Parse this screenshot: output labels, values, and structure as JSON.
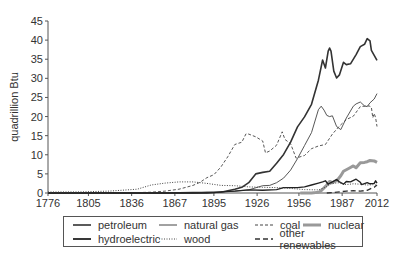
{
  "chart_data": {
    "type": "line",
    "title": "",
    "xlabel": "",
    "ylabel": "quadrillion Btu",
    "xlim": [
      1776,
      2012
    ],
    "ylim": [
      0,
      45
    ],
    "x_ticks": [
      1776,
      1805,
      1836,
      1867,
      1895,
      1926,
      1956,
      1987,
      2012
    ],
    "y_ticks": [
      0,
      5,
      10,
      15,
      20,
      25,
      30,
      35,
      40,
      45
    ],
    "grid": false,
    "legend_position": "bottom",
    "series": [
      {
        "name": "petroleum",
        "style": "solid-thick",
        "color": "#333333",
        "points": [
          [
            1776,
            0
          ],
          [
            1860,
            0
          ],
          [
            1880,
            0.1
          ],
          [
            1900,
            0.2
          ],
          [
            1910,
            1
          ],
          [
            1915,
            1.5
          ],
          [
            1920,
            2.7
          ],
          [
            1925,
            5
          ],
          [
            1930,
            5.4
          ],
          [
            1935,
            5.7
          ],
          [
            1940,
            7.8
          ],
          [
            1945,
            10.1
          ],
          [
            1950,
            13.3
          ],
          [
            1955,
            17.3
          ],
          [
            1960,
            19.9
          ],
          [
            1965,
            23.2
          ],
          [
            1970,
            29.5
          ],
          [
            1973,
            34.8
          ],
          [
            1975,
            32.7
          ],
          [
            1977,
            37.1
          ],
          [
            1978,
            37.9
          ],
          [
            1979,
            37.1
          ],
          [
            1981,
            31.9
          ],
          [
            1983,
            30.1
          ],
          [
            1985,
            30.9
          ],
          [
            1988,
            34.2
          ],
          [
            1990,
            33.6
          ],
          [
            1993,
            33.8
          ],
          [
            1997,
            36.2
          ],
          [
            2000,
            38.3
          ],
          [
            2003,
            38.9
          ],
          [
            2005,
            40.4
          ],
          [
            2007,
            39.8
          ],
          [
            2008,
            37.3
          ],
          [
            2010,
            36
          ],
          [
            2012,
            34.7
          ]
        ]
      },
      {
        "name": "natural gas",
        "style": "solid-thin",
        "color": "#444444",
        "points": [
          [
            1776,
            0
          ],
          [
            1880,
            0
          ],
          [
            1890,
            0.2
          ],
          [
            1900,
            0.3
          ],
          [
            1910,
            0.5
          ],
          [
            1920,
            0.8
          ],
          [
            1930,
            1.9
          ],
          [
            1935,
            2
          ],
          [
            1940,
            2.7
          ],
          [
            1945,
            3.9
          ],
          [
            1950,
            6
          ],
          [
            1955,
            9
          ],
          [
            1960,
            12.4
          ],
          [
            1965,
            15.8
          ],
          [
            1970,
            21.8
          ],
          [
            1972,
            22.7
          ],
          [
            1974,
            21.7
          ],
          [
            1976,
            20.3
          ],
          [
            1978,
            20
          ],
          [
            1980,
            20.2
          ],
          [
            1983,
            17.4
          ],
          [
            1986,
            16.6
          ],
          [
            1990,
            19.6
          ],
          [
            1995,
            22.7
          ],
          [
            1997,
            23.3
          ],
          [
            2000,
            23.8
          ],
          [
            2003,
            22.8
          ],
          [
            2005,
            22.6
          ],
          [
            2007,
            23.6
          ],
          [
            2010,
            24.6
          ],
          [
            2012,
            26
          ]
        ]
      },
      {
        "name": "coal",
        "style": "dashed",
        "color": "#444444",
        "points": [
          [
            1776,
            0
          ],
          [
            1840,
            0.1
          ],
          [
            1850,
            0.2
          ],
          [
            1860,
            0.5
          ],
          [
            1870,
            1
          ],
          [
            1880,
            2
          ],
          [
            1885,
            2.8
          ],
          [
            1890,
            4
          ],
          [
            1895,
            4.8
          ],
          [
            1900,
            6.8
          ],
          [
            1905,
            9.5
          ],
          [
            1910,
            12.7
          ],
          [
            1915,
            13.3
          ],
          [
            1918,
            15.5
          ],
          [
            1920,
            15.4
          ],
          [
            1925,
            14.7
          ],
          [
            1930,
            13.6
          ],
          [
            1932,
            10.5
          ],
          [
            1935,
            11
          ],
          [
            1940,
            12.5
          ],
          [
            1944,
            16
          ],
          [
            1946,
            14
          ],
          [
            1950,
            12.9
          ],
          [
            1954,
            9.1
          ],
          [
            1958,
            9.6
          ],
          [
            1960,
            9.8
          ],
          [
            1965,
            11.6
          ],
          [
            1970,
            12.3
          ],
          [
            1975,
            12.7
          ],
          [
            1980,
            15.4
          ],
          [
            1985,
            17.5
          ],
          [
            1990,
            19.2
          ],
          [
            1995,
            20.1
          ],
          [
            2000,
            22.6
          ],
          [
            2005,
            22.8
          ],
          [
            2007,
            22.7
          ],
          [
            2008,
            22.4
          ],
          [
            2009,
            19.7
          ],
          [
            2010,
            20.8
          ],
          [
            2011,
            19.7
          ],
          [
            2012,
            17.4
          ]
        ]
      },
      {
        "name": "nuclear",
        "style": "solid-heavy-gray",
        "color": "#999999",
        "points": [
          [
            1957,
            0
          ],
          [
            1965,
            0
          ],
          [
            1968,
            0.1
          ],
          [
            1970,
            0.2
          ],
          [
            1972,
            0.6
          ],
          [
            1974,
            1.3
          ],
          [
            1976,
            2.1
          ],
          [
            1978,
            3
          ],
          [
            1980,
            2.7
          ],
          [
            1982,
            3.1
          ],
          [
            1984,
            3.6
          ],
          [
            1986,
            4.5
          ],
          [
            1988,
            5.7
          ],
          [
            1990,
            6.1
          ],
          [
            1992,
            6.5
          ],
          [
            1995,
            7.1
          ],
          [
            1997,
            6.6
          ],
          [
            2000,
            7.9
          ],
          [
            2003,
            8
          ],
          [
            2005,
            8.2
          ],
          [
            2007,
            8.5
          ],
          [
            2010,
            8.4
          ],
          [
            2012,
            8
          ]
        ]
      },
      {
        "name": "hydroelectric",
        "style": "solid-medium",
        "color": "#222222",
        "points": [
          [
            1776,
            0
          ],
          [
            1890,
            0
          ],
          [
            1895,
            0.1
          ],
          [
            1900,
            0.3
          ],
          [
            1910,
            0.5
          ],
          [
            1920,
            0.8
          ],
          [
            1930,
            0.7
          ],
          [
            1940,
            0.9
          ],
          [
            1945,
            1.4
          ],
          [
            1950,
            1.4
          ],
          [
            1955,
            1.4
          ],
          [
            1960,
            1.6
          ],
          [
            1965,
            2.1
          ],
          [
            1970,
            2.6
          ],
          [
            1973,
            2.9
          ],
          [
            1975,
            3.2
          ],
          [
            1977,
            2.3
          ],
          [
            1980,
            2.9
          ],
          [
            1983,
            3.5
          ],
          [
            1985,
            2.9
          ],
          [
            1988,
            2.3
          ],
          [
            1990,
            3
          ],
          [
            1993,
            2.9
          ],
          [
            1997,
            3.6
          ],
          [
            2000,
            2.8
          ],
          [
            2001,
            2.2
          ],
          [
            2005,
            2.7
          ],
          [
            2007,
            2.4
          ],
          [
            2010,
            2.5
          ],
          [
            2011,
            3.2
          ],
          [
            2012,
            2.6
          ]
        ]
      },
      {
        "name": "wood",
        "style": "dotted",
        "color": "#444444",
        "points": [
          [
            1776,
            0.25
          ],
          [
            1800,
            0.3
          ],
          [
            1820,
            0.5
          ],
          [
            1840,
            1
          ],
          [
            1850,
            2.1
          ],
          [
            1860,
            2.6
          ],
          [
            1870,
            2.9
          ],
          [
            1880,
            2.9
          ],
          [
            1890,
            2.5
          ],
          [
            1900,
            2
          ],
          [
            1910,
            1.9
          ],
          [
            1920,
            1.6
          ],
          [
            1930,
            1.5
          ],
          [
            1940,
            1.4
          ],
          [
            1950,
            1.2
          ],
          [
            1960,
            0.9
          ],
          [
            1970,
            0.8
          ],
          [
            1975,
            1.5
          ],
          [
            1980,
            2.5
          ],
          [
            1985,
            2.7
          ],
          [
            1990,
            2.2
          ],
          [
            1995,
            2.4
          ],
          [
            2000,
            2.3
          ],
          [
            2005,
            2.1
          ],
          [
            2010,
            2.2
          ],
          [
            2012,
            2
          ]
        ]
      },
      {
        "name": "other renewables",
        "style": "long-dashed",
        "color": "#333333",
        "points": [
          [
            1976,
            0
          ],
          [
            1980,
            0.1
          ],
          [
            1985,
            0.3
          ],
          [
            1990,
            0.5
          ],
          [
            1995,
            0.6
          ],
          [
            2000,
            0.5
          ],
          [
            2005,
            0.7
          ],
          [
            2008,
            1.2
          ],
          [
            2010,
            1.5
          ],
          [
            2012,
            2.1
          ]
        ]
      }
    ]
  },
  "legend": {
    "items": [
      {
        "label": "petroleum"
      },
      {
        "label": "natural gas"
      },
      {
        "label": "coal"
      },
      {
        "label": "nuclear"
      },
      {
        "label": "hydroelectric"
      },
      {
        "label": "wood"
      },
      {
        "label": "other renewables"
      }
    ]
  }
}
